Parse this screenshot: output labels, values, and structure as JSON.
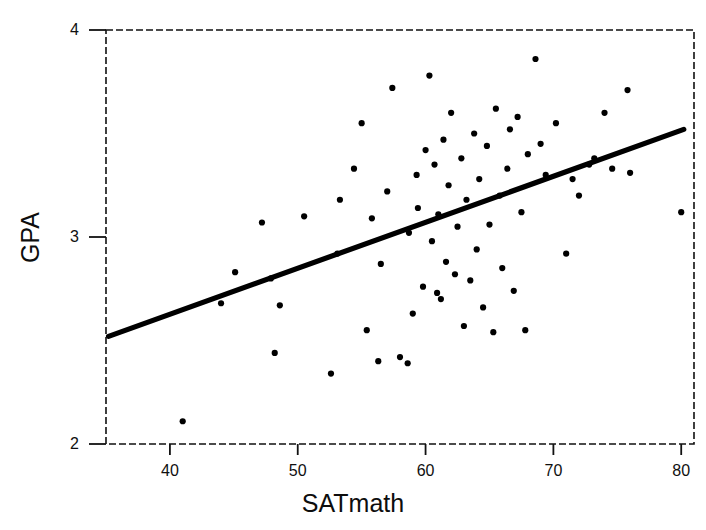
{
  "chart_data": {
    "type": "scatter",
    "title": "",
    "xlabel": "SATmath",
    "ylabel": "GPA",
    "xlim": [
      35,
      81
    ],
    "ylim": [
      2,
      4
    ],
    "xticks": [
      40,
      50,
      60,
      70,
      80
    ],
    "yticks": [
      2,
      3,
      4
    ],
    "xtick_labels": [
      "40",
      "50",
      "60",
      "70",
      "80"
    ],
    "ytick_labels": [
      "2",
      "3",
      "4"
    ],
    "grid": false,
    "legend": null,
    "frame": "dashed-box",
    "marker": "filled-circle",
    "marker_color": "#000000",
    "line_color": "#000000",
    "points": [
      {
        "x": 41.0,
        "y": 2.11
      },
      {
        "x": 44.0,
        "y": 2.68
      },
      {
        "x": 45.1,
        "y": 2.83
      },
      {
        "x": 47.2,
        "y": 3.07
      },
      {
        "x": 47.9,
        "y": 2.8
      },
      {
        "x": 48.2,
        "y": 2.44
      },
      {
        "x": 48.6,
        "y": 2.67
      },
      {
        "x": 50.5,
        "y": 3.1
      },
      {
        "x": 52.6,
        "y": 2.34
      },
      {
        "x": 53.1,
        "y": 2.92
      },
      {
        "x": 53.3,
        "y": 3.18
      },
      {
        "x": 54.4,
        "y": 3.33
      },
      {
        "x": 55.0,
        "y": 3.55
      },
      {
        "x": 55.4,
        "y": 2.55
      },
      {
        "x": 55.8,
        "y": 3.09
      },
      {
        "x": 56.3,
        "y": 2.4
      },
      {
        "x": 56.5,
        "y": 2.87
      },
      {
        "x": 57.0,
        "y": 3.22
      },
      {
        "x": 57.4,
        "y": 3.72
      },
      {
        "x": 58.0,
        "y": 2.42
      },
      {
        "x": 58.6,
        "y": 2.39
      },
      {
        "x": 58.7,
        "y": 3.02
      },
      {
        "x": 59.0,
        "y": 2.63
      },
      {
        "x": 59.3,
        "y": 3.3
      },
      {
        "x": 59.4,
        "y": 3.14
      },
      {
        "x": 59.8,
        "y": 2.76
      },
      {
        "x": 60.0,
        "y": 3.42
      },
      {
        "x": 60.3,
        "y": 3.78
      },
      {
        "x": 60.5,
        "y": 2.98
      },
      {
        "x": 60.7,
        "y": 3.35
      },
      {
        "x": 60.9,
        "y": 2.73
      },
      {
        "x": 61.0,
        "y": 3.11
      },
      {
        "x": 61.2,
        "y": 2.7
      },
      {
        "x": 61.4,
        "y": 3.47
      },
      {
        "x": 61.6,
        "y": 2.88
      },
      {
        "x": 61.8,
        "y": 3.25
      },
      {
        "x": 62.0,
        "y": 3.6
      },
      {
        "x": 62.3,
        "y": 2.82
      },
      {
        "x": 62.5,
        "y": 3.05
      },
      {
        "x": 62.8,
        "y": 3.38
      },
      {
        "x": 63.0,
        "y": 2.57
      },
      {
        "x": 63.2,
        "y": 3.18
      },
      {
        "x": 63.5,
        "y": 2.79
      },
      {
        "x": 63.8,
        "y": 3.5
      },
      {
        "x": 64.0,
        "y": 2.94
      },
      {
        "x": 64.2,
        "y": 3.28
      },
      {
        "x": 64.5,
        "y": 2.66
      },
      {
        "x": 64.8,
        "y": 3.44
      },
      {
        "x": 65.0,
        "y": 3.06
      },
      {
        "x": 65.3,
        "y": 2.54
      },
      {
        "x": 65.5,
        "y": 3.62
      },
      {
        "x": 65.8,
        "y": 3.2
      },
      {
        "x": 66.0,
        "y": 2.85
      },
      {
        "x": 66.4,
        "y": 3.33
      },
      {
        "x": 66.6,
        "y": 3.52
      },
      {
        "x": 66.9,
        "y": 2.74
      },
      {
        "x": 67.2,
        "y": 3.58
      },
      {
        "x": 67.5,
        "y": 3.12
      },
      {
        "x": 67.8,
        "y": 2.55
      },
      {
        "x": 68.0,
        "y": 3.4
      },
      {
        "x": 68.6,
        "y": 3.86
      },
      {
        "x": 69.0,
        "y": 3.45
      },
      {
        "x": 69.4,
        "y": 3.3
      },
      {
        "x": 70.2,
        "y": 3.55
      },
      {
        "x": 71.0,
        "y": 2.92
      },
      {
        "x": 71.5,
        "y": 3.28
      },
      {
        "x": 72.0,
        "y": 3.2
      },
      {
        "x": 72.8,
        "y": 3.35
      },
      {
        "x": 73.2,
        "y": 3.38
      },
      {
        "x": 74.0,
        "y": 3.6
      },
      {
        "x": 74.6,
        "y": 3.33
      },
      {
        "x": 75.8,
        "y": 3.71
      },
      {
        "x": 76.0,
        "y": 3.31
      },
      {
        "x": 80.0,
        "y": 3.12
      }
    ],
    "fit_line": {
      "type": "linear-regression",
      "x_start": 35.2,
      "y_start": 2.52,
      "x_end": 80.2,
      "y_end": 3.52
    }
  }
}
